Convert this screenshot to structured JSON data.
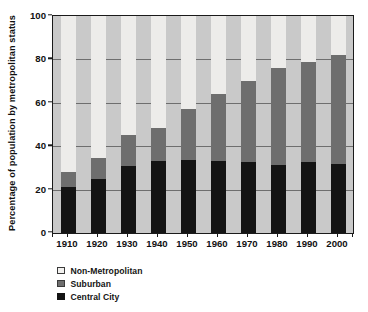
{
  "chart_data": {
    "type": "bar",
    "subtype": "stacked-bar-100",
    "title": "",
    "subtitle": "",
    "xlabel": "",
    "ylabel": "Percentage of population by metropolitan status",
    "categories": [
      "1910",
      "1920",
      "1930",
      "1940",
      "1950",
      "1960",
      "1970",
      "1980",
      "1990",
      "2000"
    ],
    "series": [
      {
        "name": "Central City",
        "color": "#141414",
        "values": [
          21,
          25,
          31,
          33,
          33.5,
          33,
          32.5,
          31.5,
          32.5,
          32
        ]
      },
      {
        "name": "Suburban",
        "color": "#6e6e6e",
        "values": [
          7,
          9.5,
          14,
          15.5,
          23.5,
          31,
          37.5,
          44.5,
          46.5,
          50
        ]
      },
      {
        "name": "Non-Metropolitan",
        "color": "#edecea",
        "values": [
          72,
          65.5,
          55,
          51.5,
          43,
          36,
          30,
          24,
          21,
          18
        ]
      }
    ],
    "stack_order_bottom_to_top": [
      "Central City",
      "Suburban",
      "Non-Metropolitan"
    ],
    "cumulative_tops": {
      "central_city": [
        21,
        25,
        31,
        33,
        33.5,
        33,
        32.5,
        31.5,
        32.5,
        32
      ],
      "suburban": [
        28,
        34.5,
        45,
        48.5,
        57,
        64,
        70,
        76,
        79,
        82
      ],
      "non_metropolitan": [
        100,
        100,
        100,
        100,
        100,
        100,
        100,
        100,
        100,
        100
      ]
    },
    "yticks": [
      0,
      20,
      40,
      60,
      80,
      100
    ],
    "ylim": [
      0,
      100
    ],
    "grid": true,
    "grid_axis": "y",
    "legend_position": "below-left",
    "plot_background": "#c9c9c9",
    "axis_color": "#1a1a1a",
    "gridline_color": "#6e6e6e"
  },
  "legend": {
    "items": [
      {
        "label": "Non-Metropolitan",
        "swatch_class": "sw-nonmetro",
        "name": "legend-item-non-metropolitan"
      },
      {
        "label": "Suburban",
        "swatch_class": "sw-suburban",
        "name": "legend-item-suburban"
      },
      {
        "label": "Central City",
        "swatch_class": "sw-central",
        "name": "legend-item-central-city"
      }
    ]
  }
}
